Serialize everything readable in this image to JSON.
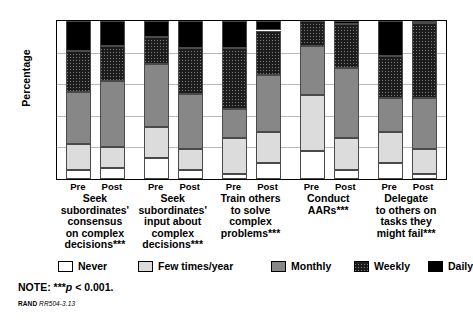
{
  "chart_data": {
    "type": "bar",
    "subtype": "stacked-bar-100",
    "title": "",
    "xlabel": "",
    "ylabel": "Percentage",
    "ylim": [
      0,
      100
    ],
    "yticks": [
      0,
      20,
      40,
      60,
      80,
      100
    ],
    "ytick_labels": [
      "0",
      "20",
      "40",
      "60",
      "80",
      "100"
    ],
    "grid": true,
    "legend_position": "bottom",
    "series": [
      {
        "name": "Never",
        "color": "#ffffff"
      },
      {
        "name": "Few times/year",
        "color": "#dcdcdc"
      },
      {
        "name": "Monthly",
        "color": "#878787"
      },
      {
        "name": "Weekly",
        "color": "#1c1c1c"
      },
      {
        "name": "Daily",
        "color": "#000000"
      }
    ],
    "groups": [
      {
        "caption": "Seek\nsubordinates'\nconsensus\non complex\ndecisions***",
        "bars": [
          {
            "label": "Pre",
            "values": {
              "Never": 6,
              "Few times/year": 16,
              "Monthly": 33,
              "Weekly": 26,
              "Daily": 19
            }
          },
          {
            "label": "Post",
            "values": {
              "Never": 7,
              "Few times/year": 13,
              "Monthly": 42,
              "Weekly": 22,
              "Daily": 16
            }
          }
        ]
      },
      {
        "caption": "Seek\nsubordinates'\ninput about\ncomplex\ndecisions***",
        "bars": [
          {
            "label": "Pre",
            "values": {
              "Never": 13,
              "Few times/year": 20,
              "Monthly": 40,
              "Weekly": 17,
              "Daily": 10
            }
          },
          {
            "label": "Post",
            "values": {
              "Never": 6,
              "Few times/year": 13,
              "Monthly": 35,
              "Weekly": 29,
              "Daily": 17
            }
          }
        ]
      },
      {
        "caption": "Train others\nto solve\ncomplex\nproblems***",
        "bars": [
          {
            "label": "Pre",
            "values": {
              "Never": 3,
              "Few times/year": 23,
              "Monthly": 18,
              "Weekly": 39,
              "Daily": 17
            }
          },
          {
            "label": "Post",
            "values": {
              "Never": 10,
              "Few times/year": 20,
              "Monthly": 36,
              "Weekly": 28,
              "Daily": 6
            }
          }
        ]
      },
      {
        "caption": "Conduct\nAARs***",
        "bars": [
          {
            "label": "Pre",
            "values": {
              "Never": 18,
              "Few times/year": 35,
              "Monthly": 31,
              "Weekly": 16,
              "Daily": 0
            }
          },
          {
            "label": "Post",
            "values": {
              "Never": 6,
              "Few times/year": 20,
              "Monthly": 44,
              "Weekly": 28,
              "Daily": 2
            }
          }
        ]
      },
      {
        "caption": "Delegate\nto others on\ntasks they\nmight fail***",
        "bars": [
          {
            "label": "Pre",
            "values": {
              "Never": 10,
              "Few times/year": 20,
              "Monthly": 21,
              "Weekly": 27,
              "Daily": 22
            }
          },
          {
            "label": "Post",
            "values": {
              "Never": 3,
              "Few times/year": 16,
              "Monthly": 32,
              "Weekly": 48,
              "Daily": 1
            }
          }
        ]
      }
    ]
  },
  "legend": {
    "items": [
      {
        "label": "Never"
      },
      {
        "label": "Few times/year"
      },
      {
        "label": "Monthly"
      },
      {
        "label": "Weekly"
      },
      {
        "label": "Daily"
      }
    ]
  },
  "note": {
    "prefix": "NOTE: ***",
    "italic": "p",
    "suffix": " < 0.001."
  },
  "source": {
    "brand": "RAND",
    "id": "RR504-3.13"
  }
}
